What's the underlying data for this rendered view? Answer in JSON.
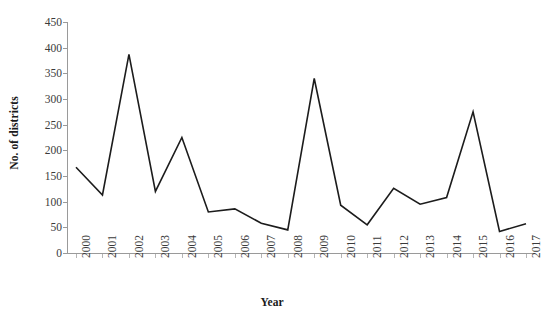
{
  "chart_data": {
    "type": "line",
    "title": "",
    "xlabel": "Year",
    "ylabel": "No. of districts",
    "categories": [
      "2000",
      "2001",
      "2002",
      "2003",
      "2004",
      "2005",
      "2006",
      "2007",
      "2008",
      "2009",
      "2010",
      "2011",
      "2012",
      "2013",
      "2014",
      "2015",
      "2016",
      "2017"
    ],
    "values": [
      167,
      113,
      387,
      120,
      225,
      80,
      86,
      58,
      45,
      340,
      93,
      55,
      126,
      95,
      108,
      275,
      42,
      57
    ],
    "series": [
      {
        "name": "No. of districts",
        "values": [
          167,
          113,
          387,
          120,
          225,
          80,
          86,
          58,
          45,
          340,
          93,
          55,
          126,
          95,
          108,
          275,
          42,
          57
        ]
      }
    ],
    "ylim": [
      0,
      450
    ],
    "ytick_labels": [
      "0",
      "50",
      "100",
      "150",
      "200",
      "250",
      "300",
      "350",
      "400",
      "450"
    ],
    "ytick_values": [
      0,
      50,
      100,
      150,
      200,
      250,
      300,
      350,
      400,
      450
    ],
    "xtick_labels": [
      "2000",
      "2001",
      "2002",
      "2003",
      "2004",
      "2005",
      "2006",
      "2007",
      "2008",
      "2009",
      "2010",
      "2011",
      "2012",
      "2013",
      "2014",
      "2015",
      "2016",
      "2017"
    ],
    "grid": false,
    "legend": false,
    "legend_position": "none",
    "line_color": "#1c1c1c",
    "markers": false,
    "axis_color": "#9a9a9a",
    "tick_label_color": "#3b3b3b",
    "axis_title_color": "#1a1a1a",
    "background": "#ffffff"
  }
}
